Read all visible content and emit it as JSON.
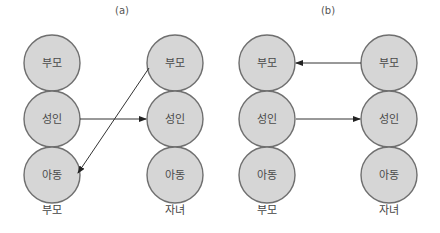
{
  "figure": {
    "panels": [
      {
        "id": "a",
        "label": "(a)",
        "label_pos": [
          122,
          14
        ],
        "columns": [
          {
            "caption": "부모",
            "x": 52,
            "nodes": [
              "부모",
              "성인",
              "아동"
            ]
          },
          {
            "caption": "자녀",
            "x": 175,
            "nodes": [
              "부모",
              "성인",
              "아동"
            ]
          }
        ],
        "edges": [
          {
            "from": "부모.성인",
            "to": "자녀.성인",
            "x1": 80,
            "y1": 119,
            "x2": 146,
            "y2": 119
          },
          {
            "from": "자녀.부모",
            "to": "부모.아동",
            "x1": 149,
            "y1": 68,
            "x2": 78,
            "y2": 173
          }
        ]
      },
      {
        "id": "b",
        "label": "(b)",
        "label_pos": [
          328,
          14
        ],
        "columns": [
          {
            "caption": "부모",
            "x": 267,
            "nodes": [
              "부모",
              "성인",
              "아동"
            ]
          },
          {
            "caption": "자녀",
            "x": 389,
            "nodes": [
              "부모",
              "성인",
              "아동"
            ]
          }
        ],
        "edges": [
          {
            "from": "자녀.부모",
            "to": "부모.부모",
            "x1": 361,
            "y1": 63,
            "x2": 296,
            "y2": 63
          },
          {
            "from": "부모.성인",
            "to": "자녀.성인",
            "x1": 296,
            "y1": 119,
            "x2": 360,
            "y2": 119
          }
        ]
      }
    ],
    "node_rows_y": [
      63,
      119,
      175
    ],
    "node_radius": 28,
    "caption_y": 214,
    "colors": {
      "node_fill": "#d6d6d6",
      "node_stroke": "#6f6f6f",
      "edge": "#333333"
    }
  }
}
